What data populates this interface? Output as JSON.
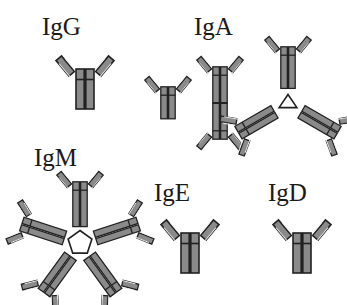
{
  "figure": {
    "background_color": "#ffffff",
    "outline_color": "#212121",
    "fill_color": "#8a8a8a",
    "highlight_color": "#f2f2f2",
    "hub_color": "#ffffff",
    "label_color": "#1a1a1a"
  },
  "isotypes": [
    {
      "id": "igg",
      "label": "IgG",
      "structure": "monomer",
      "unit_count": 1,
      "label_x": 42,
      "label_y": 14,
      "diagram_x": 55,
      "diagram_y": 48
    },
    {
      "id": "iga",
      "label": "IgA",
      "structure": "monomer, dimer, trimer",
      "unit_count": 6,
      "label_x": 194,
      "label_y": 14,
      "diagram_x": 140,
      "diagram_y": 48,
      "forms": [
        {
          "id": "iga-monomer",
          "label": "monomer",
          "unit_count": 1
        },
        {
          "id": "iga-dimer",
          "label": "dimer",
          "unit_count": 2
        },
        {
          "id": "iga-trimer",
          "label": "trimer",
          "unit_count": 3
        }
      ]
    },
    {
      "id": "igm",
      "label": "IgM",
      "structure": "pentamer",
      "unit_count": 5,
      "label_x": 34,
      "label_y": 145,
      "diagram_x": 12,
      "diagram_y": 180
    },
    {
      "id": "ige",
      "label": "IgE",
      "structure": "monomer",
      "unit_count": 1,
      "label_x": 154,
      "label_y": 180,
      "diagram_x": 160,
      "diagram_y": 212
    },
    {
      "id": "igd",
      "label": "IgD",
      "structure": "monomer",
      "unit_count": 1,
      "label_x": 268,
      "label_y": 180,
      "diagram_x": 272,
      "diagram_y": 212
    }
  ]
}
